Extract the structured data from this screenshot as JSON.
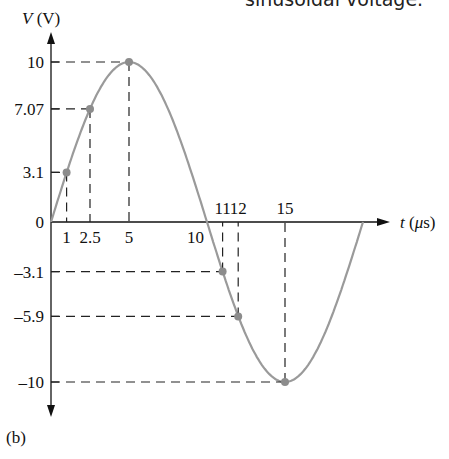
{
  "caption": "sinusoidal voltage.",
  "panel_label": "(b)",
  "colors": {
    "curve": "#9a9a9a",
    "axis": "#111111",
    "dash": "#222222",
    "marker": "#8c8c8c"
  },
  "chart_data": {
    "type": "line",
    "title": "",
    "xlabel": "t (μs)",
    "ylabel": "V (V)",
    "xlim": [
      0,
      20
    ],
    "ylim": [
      -10,
      10
    ],
    "grid": false,
    "legend": null,
    "x_tick_labels": [
      "1",
      "2.5",
      "5",
      "10",
      "11",
      "12",
      "15"
    ],
    "y_tick_labels": [
      "10",
      "7.07",
      "3.1",
      "0",
      "-3.1",
      "-5.9",
      "-10"
    ],
    "series": [
      {
        "name": "V(t) = 10 sin(2π t / 20μs)",
        "x": [
          0,
          2.5,
          5,
          7.5,
          10,
          12.5,
          15,
          17.5,
          20
        ],
        "values": [
          0,
          7.07,
          10,
          7.07,
          0,
          -7.07,
          -10,
          -7.07,
          0
        ]
      }
    ],
    "highlighted_points": [
      {
        "t": 1,
        "v": 3.1
      },
      {
        "t": 2.5,
        "v": 7.07
      },
      {
        "t": 5,
        "v": 10
      },
      {
        "t": 11,
        "v": -3.1
      },
      {
        "t": 12,
        "v": -5.9
      },
      {
        "t": 15,
        "v": -10
      }
    ]
  }
}
